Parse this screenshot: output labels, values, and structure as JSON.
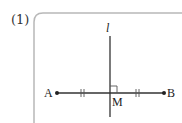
{
  "problem": {
    "number_label": "(1)"
  },
  "figure": {
    "line_label": "l",
    "point_a": "A",
    "point_b": "B",
    "midpoint": "M",
    "colors": {
      "frame": "#b8b8b8",
      "stroke": "#333333",
      "text": "#222222"
    }
  }
}
